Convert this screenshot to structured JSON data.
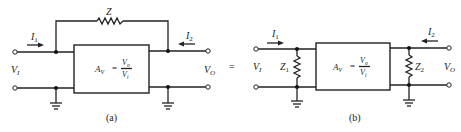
{
  "figure_a": {
    "caption": "(a)",
    "feedback_impedance": "Z",
    "input_current": {
      "sym": "I",
      "sub": "1"
    },
    "output_current": {
      "sym": "I",
      "sub": "2"
    },
    "input_voltage": {
      "sym": "V",
      "sub": "I"
    },
    "output_voltage": {
      "sym": "V",
      "sub": "O"
    },
    "gain_block": {
      "lhs": {
        "sym": "A",
        "sub": "V"
      },
      "eq": "=",
      "num": {
        "sym": "V",
        "sub": "o"
      },
      "den": {
        "sym": "V",
        "sub": "i"
      }
    }
  },
  "equals_sign": "=",
  "figure_b": {
    "caption": "(b)",
    "input_impedance": {
      "sym": "Z",
      "sub": "1"
    },
    "output_impedance": {
      "sym": "Z",
      "sub": "2"
    },
    "input_current": {
      "sym": "I",
      "sub": "1"
    },
    "output_current": {
      "sym": "I",
      "sub": "2"
    },
    "input_voltage": {
      "sym": "V",
      "sub": "I"
    },
    "output_voltage": {
      "sym": "V",
      "sub": "O"
    },
    "gain_block": {
      "lhs": {
        "sym": "A",
        "sub": "V"
      },
      "eq": "=",
      "num": {
        "sym": "V",
        "sub": "o"
      },
      "den": {
        "sym": "V",
        "sub": "i"
      }
    }
  }
}
